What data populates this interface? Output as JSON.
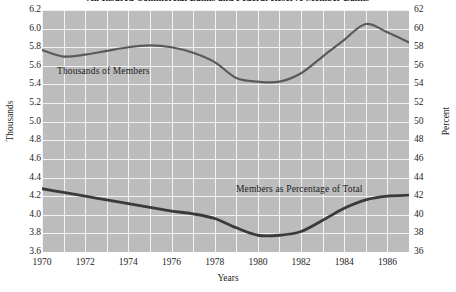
{
  "chart_data": {
    "type": "line",
    "title": "All Insured Commercial Banks and Federal Reserve Member Banks",
    "xlabel": "Years",
    "ylabel": "Thousands",
    "y2label": "Percent",
    "xlim": [
      1970,
      1987
    ],
    "ylim": [
      3.6,
      6.2
    ],
    "y2lim": [
      36,
      62
    ],
    "grid": true,
    "legend": "inline-annotations",
    "xticks": [
      1970,
      1972,
      1974,
      1976,
      1978,
      1980,
      1982,
      1984,
      1986
    ],
    "xtick_labels": [
      "1970",
      "1972",
      "1974",
      "1976",
      "1978",
      "1980",
      "1982",
      "1984",
      "1986"
    ],
    "yticks": [
      6.2,
      6.0,
      5.8,
      5.6,
      5.4,
      5.2,
      5.0,
      4.8,
      4.6,
      4.4,
      4.2,
      4.0,
      3.8,
      3.6
    ],
    "ytick_labels": [
      "6.2",
      "6.0",
      "5.8",
      "5.6",
      "5.4",
      "5.2",
      "5.0",
      "4.8",
      "4.6",
      "4.4",
      "4.2",
      "4.0",
      "3.8",
      "3.6"
    ],
    "y2ticks": [
      62,
      60,
      58,
      56,
      54,
      52,
      50,
      48,
      46,
      44,
      42,
      40,
      38,
      36
    ],
    "y2tick_labels": [
      "62",
      "60",
      "58",
      "56",
      "54",
      "52",
      "50",
      "48",
      "46",
      "44",
      "42",
      "40",
      "38",
      "36"
    ],
    "x": [
      1970,
      1971,
      1972,
      1973,
      1974,
      1975,
      1976,
      1977,
      1978,
      1979,
      1980,
      1981,
      1982,
      1983,
      1984,
      1985,
      1986,
      1987
    ],
    "series": [
      {
        "name": "Thousands of Members",
        "axis": "left",
        "units": "thousands",
        "color": "#5a5a5a",
        "annotation": "Thousands of Members",
        "values": [
          5.77,
          5.7,
          5.72,
          5.76,
          5.8,
          5.82,
          5.8,
          5.74,
          5.64,
          5.47,
          5.43,
          5.43,
          5.52,
          5.7,
          5.88,
          6.05,
          5.96,
          5.85
        ]
      },
      {
        "name": "Members as Percentage of Total",
        "axis": "right",
        "units": "percent",
        "color": "#3a3a3a",
        "annotation": "Members as Percentage of Total",
        "values": [
          42.8,
          42.4,
          42.0,
          41.6,
          41.2,
          40.8,
          40.4,
          40.1,
          39.6,
          38.6,
          37.8,
          37.8,
          38.2,
          39.4,
          40.7,
          41.6,
          42.0,
          42.1
        ]
      }
    ],
    "colors": {
      "plot_background": "#bcbcbc",
      "gridline": "#f2f2f2",
      "page_background": "#ffffff",
      "text": "#1c1c1c",
      "series_thousands": "#5a5a5a",
      "series_percent": "#3a3a3a"
    }
  }
}
